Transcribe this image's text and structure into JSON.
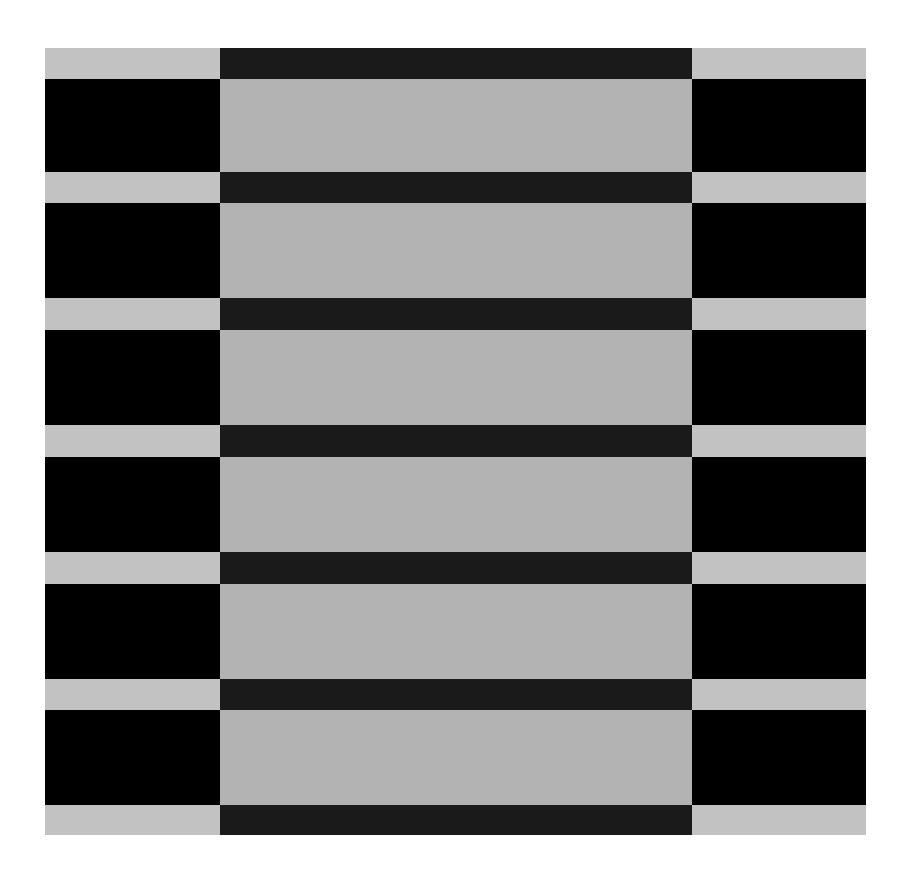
{
  "artwork": {
    "description": "Abstract grayscale illusion of alternating horizontal bands: side columns invert the center column",
    "bounds": {
      "left": 45,
      "top": 48,
      "right": 866,
      "bottom": 835
    },
    "columns": [
      {
        "name": "left",
        "x": 45,
        "width": 175
      },
      {
        "name": "center",
        "x": 220,
        "width": 472
      },
      {
        "name": "right",
        "x": 692,
        "width": 174
      }
    ],
    "colors": {
      "side_light": "#c2c2c2",
      "side_dark": "#000000",
      "center_light": "#b3b3b3",
      "center_dark": "#1a1a1a"
    },
    "rows": [
      {
        "type": "thin",
        "y": 48,
        "h": 31
      },
      {
        "type": "tall",
        "y": 79,
        "h": 93
      },
      {
        "type": "thin",
        "y": 172,
        "h": 31
      },
      {
        "type": "tall",
        "y": 203,
        "h": 95
      },
      {
        "type": "thin",
        "y": 298,
        "h": 32
      },
      {
        "type": "tall",
        "y": 330,
        "h": 95
      },
      {
        "type": "thin",
        "y": 425,
        "h": 32
      },
      {
        "type": "tall",
        "y": 457,
        "h": 95
      },
      {
        "type": "thin",
        "y": 552,
        "h": 32
      },
      {
        "type": "tall",
        "y": 584,
        "h": 95
      },
      {
        "type": "thin",
        "y": 679,
        "h": 31
      },
      {
        "type": "tall",
        "y": 710,
        "h": 95
      },
      {
        "type": "thin",
        "y": 805,
        "h": 30
      }
    ]
  }
}
